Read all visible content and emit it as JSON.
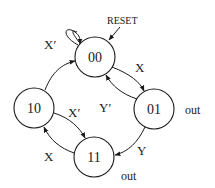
{
  "diagram": {
    "type": "state-machine",
    "reset_label": "RESET",
    "states": [
      {
        "id": "00",
        "label": "00",
        "output": ""
      },
      {
        "id": "01",
        "label": "01",
        "output": "out"
      },
      {
        "id": "10",
        "label": "10",
        "output": ""
      },
      {
        "id": "11",
        "label": "11",
        "output": "out"
      }
    ],
    "transitions": [
      {
        "from": "00",
        "to": "00",
        "label": "X′"
      },
      {
        "from": "00",
        "to": "01",
        "label": "X"
      },
      {
        "from": "01",
        "to": "00",
        "label": "Y′"
      },
      {
        "from": "01",
        "to": "11",
        "label": "Y"
      },
      {
        "from": "10",
        "to": "11",
        "label": "X′"
      },
      {
        "from": "11",
        "to": "10",
        "label": "X"
      },
      {
        "from": "10",
        "to": "00",
        "label": ""
      }
    ],
    "colors": {
      "stroke": "#1a1a1a",
      "background": "#ffffff"
    }
  }
}
